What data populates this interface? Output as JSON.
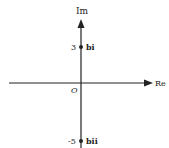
{
  "diagram": {
    "type": "argand-diagram",
    "axes": {
      "real_label": "Re",
      "imag_label": "Im",
      "origin_label": "O"
    },
    "points": [
      {
        "value": "3",
        "label": "bi",
        "im": 3
      },
      {
        "value": "-5",
        "label": "bii",
        "im": -5
      }
    ],
    "colors": {
      "axis": "#222222",
      "text": "#222222",
      "background": "#ffffff"
    }
  }
}
